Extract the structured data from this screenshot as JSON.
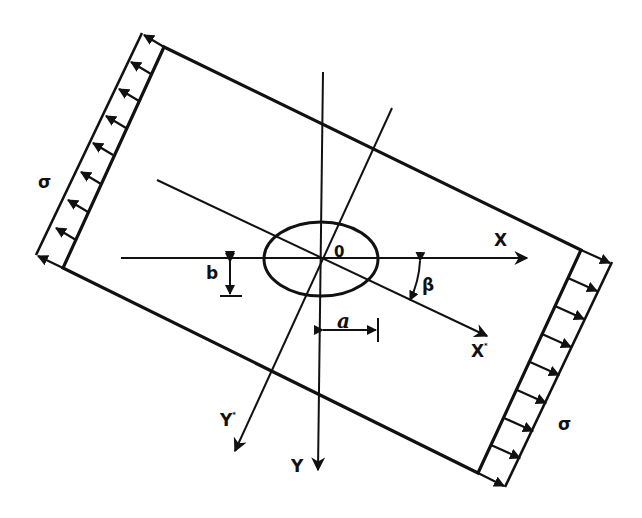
{
  "diagram": {
    "type": "inclined elliptical hole in plate under uniaxial tension",
    "colors": {
      "stroke": "#111111",
      "background": "#ffffff"
    },
    "labels": {
      "stress_left": "σ",
      "stress_right": "σ",
      "origin": "0",
      "x_axis": "X",
      "y_axis": "Y",
      "x_star_axis": "X",
      "x_star_mark": "*",
      "y_star_axis": "Y",
      "y_star_mark": "*",
      "semi_axis_a": "a",
      "semi_axis_b": "b",
      "angle": "β"
    },
    "load": {
      "arrows_per_side": 8,
      "direction": "outward (tension)"
    }
  }
}
